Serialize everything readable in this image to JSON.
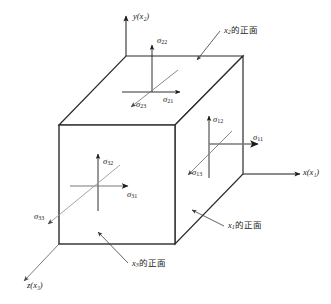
{
  "figure": {
    "background_color": "#ffffff",
    "ink_color": "#1a1a1a",
    "edge_color": "#2b2b2b",
    "arrow_color": "#555555",
    "leader_color": "#4a4a4a"
  },
  "axes": [
    {
      "id": "y-axis",
      "label_main": "y",
      "label_paren_open": "(",
      "label_sub": "x",
      "label_sub_index": "2",
      "label_paren_close": ")",
      "direction": "up"
    },
    {
      "id": "x-axis",
      "label_main": "x",
      "label_paren_open": "(",
      "label_sub": "x",
      "label_sub_index": "1",
      "label_paren_close": ")",
      "direction": "right"
    },
    {
      "id": "z-axis",
      "label_main": "z",
      "label_paren_open": "(",
      "label_sub": "x",
      "label_sub_index": "3",
      "label_paren_close": ")",
      "direction": "down-left"
    }
  ],
  "axis_labels": {
    "y": "y(x₂)",
    "x": "x(x₁)",
    "z": "z(x₃)"
  },
  "stress_components": [
    {
      "id": "sigma-22",
      "symbol": "σ",
      "sub": "22",
      "face": "x2-positive",
      "direction": "up",
      "x": 157,
      "y": 36
    },
    {
      "id": "sigma-21",
      "symbol": "σ",
      "sub": "21",
      "face": "x2-positive",
      "direction": "right",
      "x": 163,
      "y": 95
    },
    {
      "id": "sigma-23",
      "symbol": "σ",
      "sub": "23",
      "face": "x2-positive",
      "direction": "down-left",
      "x": 136,
      "y": 100
    },
    {
      "id": "sigma-12",
      "symbol": "σ",
      "sub": "12",
      "face": "x1-positive",
      "direction": "up",
      "x": 213,
      "y": 118
    },
    {
      "id": "sigma-11",
      "symbol": "σ",
      "sub": "11",
      "face": "x1-positive",
      "direction": "right",
      "x": 253,
      "y": 139
    },
    {
      "id": "sigma-13",
      "symbol": "σ",
      "sub": "13",
      "face": "x1-positive",
      "direction": "down-left",
      "x": 192,
      "y": 169
    },
    {
      "id": "sigma-32",
      "symbol": "σ",
      "sub": "32",
      "face": "x3-positive",
      "direction": "up",
      "x": 103,
      "y": 159
    },
    {
      "id": "sigma-31",
      "symbol": "σ",
      "sub": "31",
      "face": "x3-positive",
      "direction": "right",
      "x": 127,
      "y": 193
    },
    {
      "id": "sigma-33",
      "symbol": "σ",
      "sub": "33",
      "face": "x3-positive",
      "direction": "down-left",
      "x": 38,
      "y": 213
    }
  ],
  "annotations": [
    {
      "id": "annotation-x2-face",
      "axis_symbol": "x",
      "axis_index": "2",
      "text_suffix": "的正面",
      "full_text": "x₂的正面",
      "x": 222,
      "y": 29
    },
    {
      "id": "annotation-x1-face",
      "axis_symbol": "x",
      "axis_index": "1",
      "text_suffix": "的正面",
      "full_text": "x₁的正面",
      "x": 225,
      "y": 224
    },
    {
      "id": "annotation-x3-face",
      "axis_symbol": "x",
      "axis_index": "3",
      "text_suffix": "的正面",
      "full_text": "x₃的正面",
      "x": 130,
      "y": 262
    }
  ],
  "cube": {
    "front_top_left": [
      59,
      125
    ],
    "front_top_right": [
      175,
      125
    ],
    "front_bottom_left": [
      59,
      244
    ],
    "front_bottom_right": [
      175,
      244
    ],
    "back_top_left": [
      126,
      56
    ],
    "back_top_right": [
      243,
      56
    ],
    "back_bottom_right": [
      243,
      174
    ]
  }
}
